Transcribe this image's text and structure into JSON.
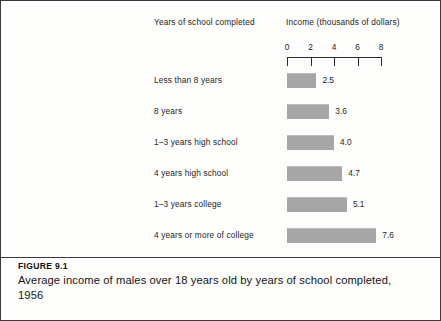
{
  "figure": {
    "number": "FIGURE 9.1",
    "caption": "Average income of males over 18 years old by years of school completed, 1956"
  },
  "headers": {
    "category": "Years of school completed",
    "value": "Income (thousands of dollars)"
  },
  "chart_data": {
    "type": "bar",
    "orientation": "horizontal",
    "title": "Average income of males over 18 years old by years of school completed, 1956",
    "xlabel": "Income (thousands of dollars)",
    "ylabel": "Years of school completed",
    "xlim": [
      0,
      8
    ],
    "grid": false,
    "legend": false,
    "ticks": [
      "0",
      "2",
      "4",
      "6",
      "8"
    ],
    "tick_values": [
      0,
      2,
      4,
      6,
      8
    ],
    "bar_color": "#a6a6a6",
    "categories": [
      "Less than 8 years",
      "8 years",
      "1–3 years high school",
      "4 years high school",
      "1–3 years college",
      "4 years or more of college"
    ],
    "values": [
      2.5,
      3.6,
      4.0,
      4.7,
      5.1,
      7.6
    ],
    "value_labels": [
      "2.5",
      "3.6",
      "4.0",
      "4.7",
      "5.1",
      "7.6"
    ]
  }
}
